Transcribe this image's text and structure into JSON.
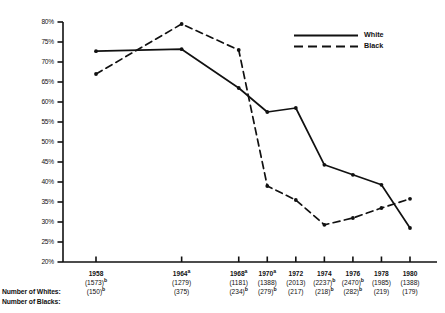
{
  "chart_data": {
    "type": "line",
    "title": "",
    "xlabel": "",
    "ylabel": "",
    "ylim": [
      20,
      80
    ],
    "ytick_step": 5,
    "grid": false,
    "legend_position": "top-right",
    "x": [
      1958,
      1964,
      1968,
      1970,
      1972,
      1974,
      1976,
      1978,
      1980
    ],
    "categories": [
      "1958",
      "1964",
      "1968",
      "1970",
      "1972",
      "1974",
      "1976",
      "1978",
      "1980"
    ],
    "ytick_labels": [
      "80%",
      "75%",
      "70%",
      "65%",
      "60%",
      "55%",
      "50%",
      "45%",
      "40%",
      "35%",
      "30%",
      "25%",
      "20%"
    ],
    "ytick_values": [
      80,
      75,
      70,
      65,
      60,
      55,
      50,
      45,
      40,
      35,
      30,
      25,
      20
    ],
    "series": [
      {
        "name": "White",
        "style": "solid",
        "values": [
          72.7,
          73.2,
          63.5,
          57.5,
          58.5,
          44.3,
          41.8,
          39.3,
          28.5
        ]
      },
      {
        "name": "Black",
        "style": "dashed",
        "values": [
          67.0,
          79.5,
          73.0,
          39.0,
          35.5,
          29.3,
          31.0,
          33.5,
          35.8
        ]
      }
    ],
    "x_axis_groups": [
      {
        "year": "1958",
        "year_sup": "",
        "whites": "(1573)",
        "whites_sup": "b",
        "blacks": "(150)",
        "blacks_sup": "b"
      },
      {
        "year": "1964",
        "year_sup": "a",
        "whites": "(1279)",
        "whites_sup": "",
        "blacks": "(375)",
        "blacks_sup": ""
      },
      {
        "year": "1968",
        "year_sup": "a",
        "whites": "(1181)",
        "whites_sup": "",
        "blacks": "(234)",
        "blacks_sup": "b"
      },
      {
        "year": "1970",
        "year_sup": "a",
        "whites": "(1388)",
        "whites_sup": "",
        "blacks": "(279)",
        "blacks_sup": "b"
      },
      {
        "year": "1972",
        "year_sup": "",
        "whites": "(2013)",
        "whites_sup": "",
        "blacks": "(217)",
        "blacks_sup": ""
      },
      {
        "year": "1974",
        "year_sup": "",
        "whites": "(2237)",
        "whites_sup": "b",
        "blacks": "(218)",
        "blacks_sup": "b"
      },
      {
        "year": "1976",
        "year_sup": "",
        "whites": "(2470)",
        "whites_sup": "b",
        "blacks": "(282)",
        "blacks_sup": "b"
      },
      {
        "year": "1978",
        "year_sup": "",
        "whites": "(1985)",
        "whites_sup": "",
        "blacks": "(219)",
        "blacks_sup": ""
      },
      {
        "year": "1980",
        "year_sup": "",
        "whites": "(1388)",
        "whites_sup": "",
        "blacks": "(179)",
        "blacks_sup": ""
      }
    ]
  },
  "axis": {
    "y_labels": [
      "80%",
      "75%",
      "70%",
      "65%",
      "60%",
      "55%",
      "50%",
      "45%",
      "40%",
      "35%",
      "30%",
      "25%",
      "20%"
    ]
  },
  "legend": {
    "items": [
      {
        "label": "White",
        "style": "solid"
      },
      {
        "label": "Black",
        "style": "dashed"
      }
    ]
  },
  "row_captions": {
    "whites": "Number of Whites:",
    "blacks": "Number of Blacks:"
  }
}
